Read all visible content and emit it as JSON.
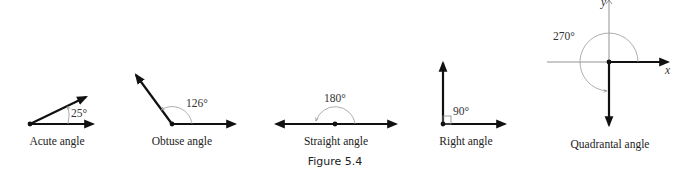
{
  "figure": {
    "caption": "Figure 5.4",
    "panels": [
      {
        "id": "acute",
        "angle_label": "25°",
        "caption": "Acute angle",
        "degrees": 25
      },
      {
        "id": "obtuse",
        "angle_label": "126°",
        "caption": "Obtuse angle",
        "degrees": 126
      },
      {
        "id": "straight",
        "angle_label": "180°",
        "caption": "Straight angle",
        "degrees": 180
      },
      {
        "id": "right",
        "angle_label": "90°",
        "caption": "Right angle",
        "degrees": 90
      },
      {
        "id": "quadrantal",
        "angle_label": "270°",
        "caption": "Quadrantal angle",
        "degrees": 270,
        "axis_labels": {
          "x": "x",
          "y": "y"
        }
      }
    ]
  },
  "colors": {
    "ray": "#111111",
    "arc": "#999999",
    "axis": "#777777",
    "text": "#222222"
  }
}
